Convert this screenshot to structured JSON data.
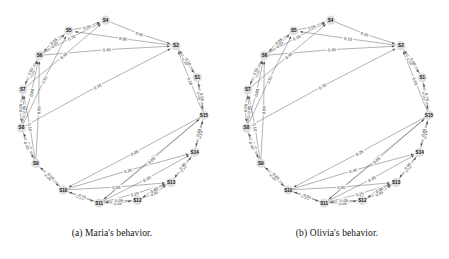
{
  "figure": {
    "panels": [
      {
        "id": "panel-a",
        "caption": "(a) Maria's behavior.",
        "chart_data": {
          "type": "diagram",
          "title": "Maria's behavior.",
          "layout": "circular",
          "nodes": [
            "S1",
            "S2",
            "S3",
            "S4",
            "S5",
            "S6",
            "S7",
            "S8",
            "S9",
            "S10",
            "S11",
            "S12",
            "S13",
            "S14",
            "S15"
          ],
          "visible_nodes": [
            "S1",
            "S2",
            "S4",
            "S5",
            "S6",
            "S7",
            "S8",
            "S9",
            "S10",
            "S11",
            "S12",
            "S13",
            "S14",
            "S15"
          ],
          "directed": true,
          "edges": [
            {
              "from": "S6",
              "to": "S5",
              "label": "0.05"
            },
            {
              "from": "S7",
              "to": "S6",
              "label": "0.05"
            },
            {
              "from": "S6",
              "to": "S7",
              "label": "0.50"
            },
            {
              "from": "S5",
              "to": "S6",
              "label": "0.05"
            },
            {
              "from": "S5",
              "to": "S4",
              "label": "0.05"
            },
            {
              "from": "S7",
              "to": "S4",
              "label": "0.40"
            },
            {
              "from": "S8",
              "to": "S7",
              "label": "0.05"
            },
            {
              "from": "S7",
              "to": "S8",
              "label": "0.05"
            },
            {
              "from": "S6",
              "to": "S2",
              "label": "0.40"
            },
            {
              "from": "S4",
              "to": "S2",
              "label": "0.05"
            },
            {
              "from": "S8",
              "to": "S5",
              "label": "0.50"
            },
            {
              "from": "S6",
              "to": "S4",
              "label": "0.70"
            },
            {
              "from": "S8",
              "to": "S6",
              "label": "0.80"
            },
            {
              "from": "S8",
              "to": "S2",
              "label": "0.15"
            },
            {
              "from": "S2",
              "to": "S5",
              "label": "0.90"
            },
            {
              "from": "S2",
              "to": "S1",
              "label": "0.10"
            },
            {
              "from": "S9",
              "to": "S8",
              "label": "0.45"
            },
            {
              "from": "S8",
              "to": "S9",
              "label": "0.45"
            },
            {
              "from": "S9",
              "to": "S6",
              "label": "0.80"
            },
            {
              "from": "S9",
              "to": "S7",
              "label": "0.10"
            },
            {
              "from": "S1",
              "to": "S2",
              "label": "0.10"
            },
            {
              "from": "S1",
              "to": "S15",
              "label": "0.05"
            },
            {
              "from": "S15",
              "to": "S1",
              "label": "0.55"
            },
            {
              "from": "S15",
              "to": "S2",
              "label": "0.20"
            },
            {
              "from": "S9",
              "to": "S10",
              "label": "0.05"
            },
            {
              "from": "S10",
              "to": "S9",
              "label": "0.10"
            },
            {
              "from": "S10",
              "to": "S11",
              "label": "0.25"
            },
            {
              "from": "S10",
              "to": "S13",
              "label": "0.55"
            },
            {
              "from": "S10",
              "to": "S14",
              "label": "0.20"
            },
            {
              "from": "S11",
              "to": "S10",
              "label": "0.70"
            },
            {
              "from": "S11",
              "to": "S12",
              "label": "0.05"
            },
            {
              "from": "S12",
              "to": "S11",
              "label": "0.05"
            },
            {
              "from": "S11",
              "to": "S13",
              "label": "0.20"
            },
            {
              "from": "S12",
              "to": "S13",
              "label": "0.05"
            },
            {
              "from": "S11",
              "to": "S14",
              "label": "0.10"
            },
            {
              "from": "S13",
              "to": "S12",
              "label": "0.80"
            },
            {
              "from": "S13",
              "to": "S14",
              "label": "0.10"
            },
            {
              "from": "S14",
              "to": "S13",
              "label": "0.80"
            },
            {
              "from": "S14",
              "to": "S15",
              "label": "0.10"
            },
            {
              "from": "S15",
              "to": "S11",
              "label": "0.80"
            },
            {
              "from": "S15",
              "to": "S14",
              "label": "0.80"
            },
            {
              "from": "S15",
              "to": "S10",
              "label": "0.05"
            },
            {
              "from": "S11",
              "to": "S15",
              "label": "0.05"
            }
          ]
        }
      },
      {
        "id": "panel-b",
        "caption": "(b) Olivia's behavior.",
        "chart_data": {
          "type": "diagram",
          "title": "Olivia's behavior.",
          "layout": "circular",
          "nodes": [
            "S1",
            "S2",
            "S3",
            "S4",
            "S5",
            "S6",
            "S7",
            "S8",
            "S9",
            "S10",
            "S11",
            "S12",
            "S13",
            "S14",
            "S15"
          ],
          "visible_nodes": [
            "S1",
            "S2",
            "S4",
            "S5",
            "S6",
            "S7",
            "S8",
            "S9",
            "S10",
            "S11",
            "S12",
            "S13",
            "S14",
            "S15"
          ],
          "directed": true,
          "edges": [
            {
              "from": "S6",
              "to": "S5",
              "label": "0.05"
            },
            {
              "from": "S7",
              "to": "S6",
              "label": "0.05"
            },
            {
              "from": "S6",
              "to": "S7",
              "label": "0.50"
            },
            {
              "from": "S5",
              "to": "S6",
              "label": "0.05"
            },
            {
              "from": "S5",
              "to": "S4",
              "label": "0.05"
            },
            {
              "from": "S7",
              "to": "S4",
              "label": "0.40"
            },
            {
              "from": "S8",
              "to": "S7",
              "label": "0.05"
            },
            {
              "from": "S7",
              "to": "S8",
              "label": "0.05"
            },
            {
              "from": "S6",
              "to": "S2",
              "label": "0.40"
            },
            {
              "from": "S4",
              "to": "S2",
              "label": "0.10"
            },
            {
              "from": "S8",
              "to": "S5",
              "label": "0.50"
            },
            {
              "from": "S6",
              "to": "S4",
              "label": "0.10"
            },
            {
              "from": "S8",
              "to": "S6",
              "label": "0.80"
            },
            {
              "from": "S8",
              "to": "S2",
              "label": "0.70"
            },
            {
              "from": "S2",
              "to": "S5",
              "label": "0.10"
            },
            {
              "from": "S2",
              "to": "S1",
              "label": "0.10"
            },
            {
              "from": "S9",
              "to": "S8",
              "label": "0.25"
            },
            {
              "from": "S8",
              "to": "S9",
              "label": "0.40"
            },
            {
              "from": "S9",
              "to": "S6",
              "label": "0.80"
            },
            {
              "from": "S9",
              "to": "S7",
              "label": "0.10"
            },
            {
              "from": "S1",
              "to": "S2",
              "label": "0.60"
            },
            {
              "from": "S1",
              "to": "S15",
              "label": "0.50"
            },
            {
              "from": "S15",
              "to": "S1",
              "label": "0.70"
            },
            {
              "from": "S15",
              "to": "S2",
              "label": "0.05"
            },
            {
              "from": "S9",
              "to": "S10",
              "label": "0.05"
            },
            {
              "from": "S10",
              "to": "S9",
              "label": "0.65"
            },
            {
              "from": "S10",
              "to": "S11",
              "label": "0.10"
            },
            {
              "from": "S10",
              "to": "S13",
              "label": "0.50"
            },
            {
              "from": "S10",
              "to": "S14",
              "label": "0.40"
            },
            {
              "from": "S11",
              "to": "S10",
              "label": "0.65"
            },
            {
              "from": "S11",
              "to": "S12",
              "label": "0.05"
            },
            {
              "from": "S12",
              "to": "S11",
              "label": "0.05"
            },
            {
              "from": "S11",
              "to": "S13",
              "label": "0.25"
            },
            {
              "from": "S12",
              "to": "S13",
              "label": "0.05"
            },
            {
              "from": "S11",
              "to": "S14",
              "label": "0.20"
            },
            {
              "from": "S13",
              "to": "S12",
              "label": "0.90"
            },
            {
              "from": "S13",
              "to": "S14",
              "label": "0.10"
            },
            {
              "from": "S14",
              "to": "S13",
              "label": "0.90"
            },
            {
              "from": "S14",
              "to": "S15",
              "label": "0.10"
            },
            {
              "from": "S15",
              "to": "S11",
              "label": "0.70"
            },
            {
              "from": "S15",
              "to": "S14",
              "label": "0.80"
            },
            {
              "from": "S15",
              "to": "S10",
              "label": "0.25"
            },
            {
              "from": "S11",
              "to": "S15",
              "label": "0.05"
            }
          ]
        }
      }
    ],
    "colors": {
      "edge": "#555555",
      "node_fill": "#d8d8d8",
      "node_text": "#111111",
      "label_text": "#222222",
      "background": "#ffffff"
    }
  }
}
